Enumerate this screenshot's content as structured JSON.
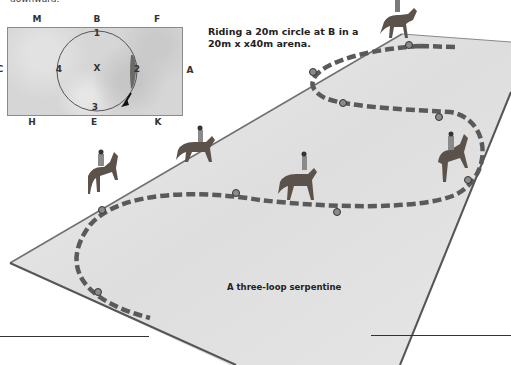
{
  "top_fragment": "downward.",
  "inset": {
    "markers": {
      "M": "M",
      "B": "B",
      "F": "F",
      "C": "C",
      "A": "A",
      "H": "H",
      "E": "E",
      "K": "K"
    },
    "centre_label": "X",
    "circle_points": [
      "1",
      "2",
      "3",
      "4"
    ],
    "arrow_direction": "clockwise"
  },
  "annotation": {
    "line1": "Riding a 20m circle at B in a",
    "line2": "20m x x40m arena."
  },
  "arena_caption": "A three-loop serpentine",
  "colors": {
    "arena_fill": "#e2e2e2",
    "arena_edge": "#6e6e6e",
    "track_dash": "#5a5a5a",
    "inset_fill": "#d6d6d6"
  },
  "riders": [
    {
      "id": "rider-top",
      "label": "horse and rider"
    },
    {
      "id": "rider-left",
      "label": "horse and rider"
    },
    {
      "id": "rider-mid-left",
      "label": "horse and rider"
    },
    {
      "id": "rider-mid",
      "label": "horse and rider"
    },
    {
      "id": "rider-right",
      "label": "horse and rider"
    }
  ]
}
